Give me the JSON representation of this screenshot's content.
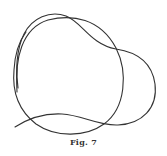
{
  "figure": {
    "caption": "Fig. 7",
    "stroke_color": "#333333",
    "curves": [
      {
        "name": "closed-loop-curve",
        "path": "M 18 88 C 14 60, 22 28, 48 20 C 72 14, 100 18, 116 48 C 128 72, 126 108, 104 124 C 86 137, 56 138, 36 124 C 18 110, 12 92, 14 70 C 15 52, 20 40, 26 32"
      },
      {
        "name": "bulb-curve",
        "path": "M 17 92 C 16 70, 16 50, 24 34 C 32 18, 50 10, 66 16 C 82 22, 90 44, 116 49 C 136 52, 152 62, 155 84 C 158 108, 142 124, 118 125 C 98 126, 82 115, 62 114 C 42 113, 26 120, 15 127"
      }
    ]
  }
}
